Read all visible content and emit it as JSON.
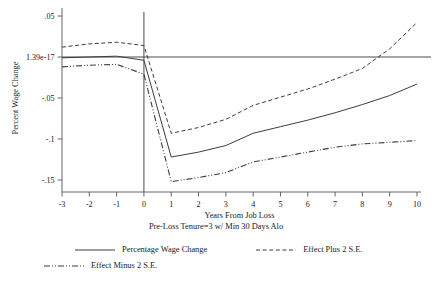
{
  "chart_data": {
    "type": "line",
    "title": "",
    "subtitle": "Pre-Loss Tenure=3 w/ Min 30 Days Alo",
    "xlabel": "Years From Job Loss",
    "ylabel": "Percent Wage Change",
    "x": [
      -3,
      -2,
      -1,
      0,
      1,
      2,
      3,
      4,
      5,
      6,
      7,
      8,
      9,
      10
    ],
    "xlim": [
      -3,
      10
    ],
    "ylim": [
      -0.165,
      0.058
    ],
    "xticks": [
      -3,
      -2,
      -1,
      0,
      1,
      2,
      3,
      4,
      5,
      6,
      7,
      8,
      9,
      10
    ],
    "xtick_labels": [
      "-3",
      "-2",
      "-1",
      "0",
      "1",
      "2",
      "3",
      "4",
      "5",
      "6",
      "7",
      "8",
      "9",
      "10"
    ],
    "yticks": [
      0.05,
      0.0,
      -0.05,
      -0.1,
      -0.15
    ],
    "ytick_labels": [
      ".05",
      "1.39e-17",
      "-.05",
      "-.1",
      "-.15"
    ],
    "grid": false,
    "legend_position": "below",
    "reference_lines": {
      "horizontal_y": 0.0,
      "vertical_x": 0.0
    },
    "series": [
      {
        "name": "Percentage Wage Change",
        "style": "solid",
        "color": "#3d3d3d",
        "values": [
          -0.001,
          0.0,
          0.001,
          -0.004,
          -0.122,
          -0.116,
          -0.108,
          -0.093,
          -0.085,
          -0.077,
          -0.068,
          -0.058,
          -0.047,
          -0.033
        ]
      },
      {
        "name": "Effect Plus 2 S.E.",
        "style": "dashed",
        "color": "#3d3d3d",
        "values": [
          0.012,
          0.016,
          0.018,
          0.014,
          -0.093,
          -0.086,
          -0.076,
          -0.059,
          -0.049,
          -0.039,
          -0.027,
          -0.014,
          0.01,
          0.042
        ]
      },
      {
        "name": "Effect Minus 2 S.E.",
        "style": "dashdot",
        "color": "#3d3d3d",
        "values": [
          -0.012,
          -0.01,
          -0.009,
          -0.021,
          -0.152,
          -0.147,
          -0.141,
          -0.128,
          -0.122,
          -0.116,
          -0.11,
          -0.106,
          -0.104,
          -0.102
        ]
      }
    ],
    "legend": [
      {
        "label": "Percentage Wage Change",
        "style": "solid"
      },
      {
        "label": "Effect Plus 2 S.E.",
        "style": "dashed"
      },
      {
        "label": "Effect Minus 2 S.E.",
        "style": "dashdot"
      }
    ]
  }
}
